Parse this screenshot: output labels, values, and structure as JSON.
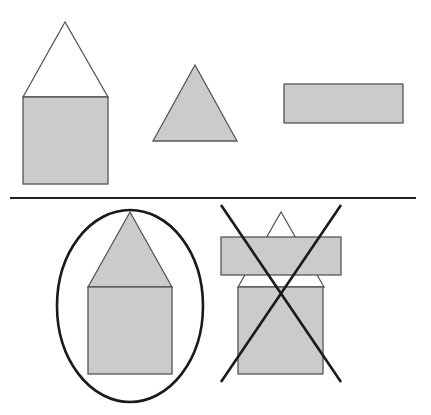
{
  "diagram": {
    "colors": {
      "fill_gray": "#cbcbcb",
      "fill_white": "#ffffff",
      "outline": "#555555",
      "mark": "#1a1a1a",
      "background": "#ffffff"
    },
    "top_row": {
      "items": [
        {
          "name": "house",
          "parts": [
            "white triangle roof",
            "gray square body"
          ]
        },
        {
          "name": "gray triangle"
        },
        {
          "name": "gray rectangle"
        }
      ]
    },
    "divider": {
      "orientation": "horizontal"
    },
    "bottom_row": {
      "items": [
        {
          "name": "circled house",
          "mark": "circle",
          "meaning": "correct",
          "parts": [
            "gray triangle roof",
            "gray square body"
          ]
        },
        {
          "name": "crossed composition",
          "mark": "X",
          "meaning": "incorrect",
          "parts": [
            "white triangle",
            "gray rectangle",
            "gray square body"
          ]
        }
      ]
    }
  }
}
